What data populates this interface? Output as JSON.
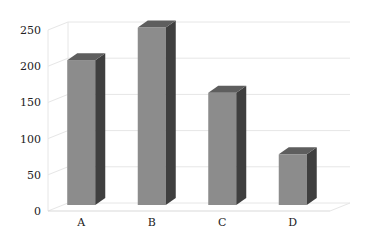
{
  "chart_data": {
    "type": "bar",
    "style": "3d-column",
    "title": "",
    "xlabel": "",
    "ylabel": "",
    "categories": [
      "A",
      "B",
      "C",
      "D"
    ],
    "values": [
      200,
      245,
      155,
      70
    ],
    "ylim": [
      0,
      250
    ],
    "yticks": [
      0,
      50,
      100,
      150,
      200,
      250
    ],
    "grid": true,
    "legend": "none",
    "colors": {
      "front": "#8c8c8c",
      "top": "#5e5e5e",
      "side": "#3f3f3f",
      "grid": "#e6e6e6",
      "axis_text": "#222222"
    }
  }
}
